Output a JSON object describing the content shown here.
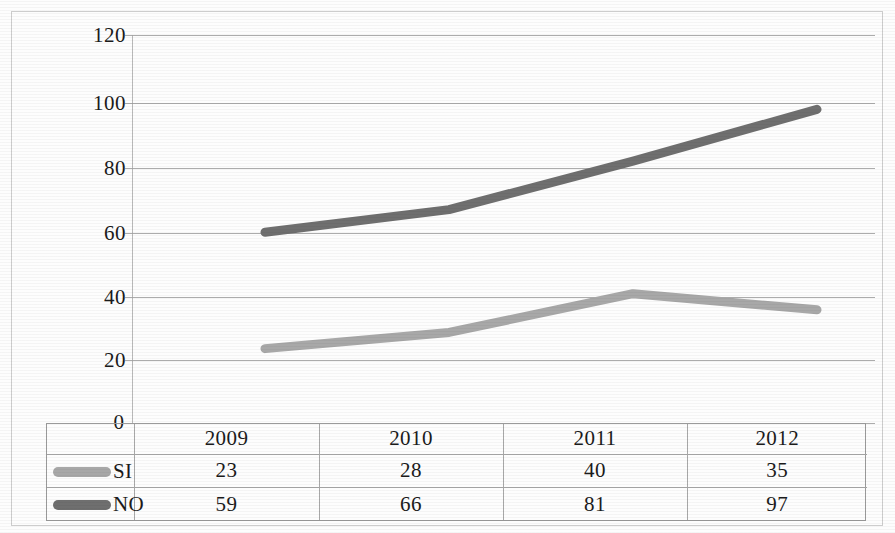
{
  "chart_data": {
    "type": "line",
    "title": "",
    "xlabel": "",
    "ylabel": "",
    "categories": [
      "2009",
      "2010",
      "2011",
      "2012"
    ],
    "series": [
      {
        "name": "SI",
        "values": [
          23,
          28,
          40,
          35
        ],
        "color": "#a8a8a8"
      },
      {
        "name": "NO",
        "values": [
          59,
          66,
          81,
          97
        ],
        "color": "#6f6f6f"
      }
    ],
    "ylim": [
      0,
      120
    ],
    "yticks": [
      0,
      20,
      40,
      60,
      80,
      100,
      120
    ],
    "ytick_labels": [
      "0",
      "20",
      "40",
      "60",
      "80",
      "100",
      "120"
    ],
    "grid": true,
    "legend_position": "table-below"
  },
  "axis": {
    "y_labels": [
      "120",
      "100",
      "80",
      "60",
      "40",
      "20",
      "0"
    ]
  },
  "table": {
    "header": [
      "",
      "2009",
      "2010",
      "2011",
      "2012"
    ],
    "rows": [
      {
        "label": "SI",
        "swatch_color": "#a8a8a8",
        "values": [
          "23",
          "28",
          "40",
          "35"
        ]
      },
      {
        "label": "NO",
        "swatch_color": "#6f6f6f",
        "values": [
          "59",
          "66",
          "81",
          "97"
        ]
      }
    ]
  }
}
